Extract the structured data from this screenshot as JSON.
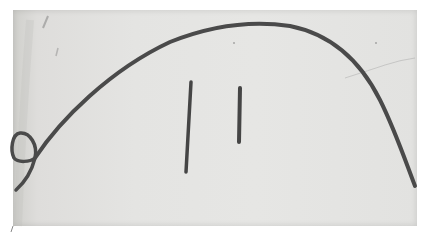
{
  "image": {
    "description": "Grayscale photograph of a hand-drawn dark arc (rainbow-like curve) with a small loop at the lower left, and two short vertical strokes under the arc",
    "colors": {
      "background": "#ffffff",
      "paper": "#e4e4e2",
      "stroke": "#4a4a4a"
    },
    "elements": [
      "arc-curve",
      "loop",
      "vertical-stroke-left",
      "vertical-stroke-right"
    ]
  }
}
